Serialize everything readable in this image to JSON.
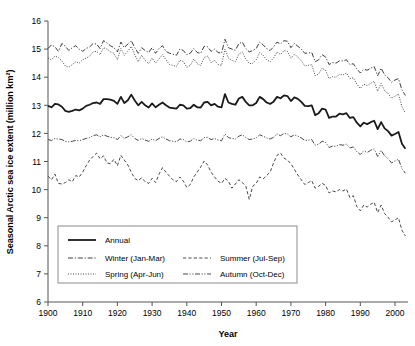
{
  "chart_data": {
    "type": "line",
    "title": "",
    "xlabel": "Year",
    "ylabel": "Seasonal Arctic sea ice extent (million km²)",
    "xlim": [
      1900,
      2004
    ],
    "ylim": [
      6,
      16
    ],
    "xticks": [
      1900,
      1910,
      1920,
      1930,
      1940,
      1950,
      1960,
      1970,
      1980,
      1990,
      2000
    ],
    "yticks": [
      6,
      7,
      8,
      9,
      10,
      11,
      12,
      13,
      14,
      15,
      16
    ],
    "grid": false,
    "legend_position": "lower-left-inside",
    "x": [
      1900,
      1901,
      1902,
      1903,
      1904,
      1905,
      1906,
      1907,
      1908,
      1909,
      1910,
      1911,
      1912,
      1913,
      1914,
      1915,
      1916,
      1917,
      1918,
      1919,
      1920,
      1921,
      1922,
      1923,
      1924,
      1925,
      1926,
      1927,
      1928,
      1929,
      1930,
      1931,
      1932,
      1933,
      1934,
      1935,
      1936,
      1937,
      1938,
      1939,
      1940,
      1941,
      1942,
      1943,
      1944,
      1945,
      1946,
      1947,
      1948,
      1949,
      1950,
      1951,
      1952,
      1953,
      1954,
      1955,
      1956,
      1957,
      1958,
      1959,
      1960,
      1961,
      1962,
      1963,
      1964,
      1965,
      1966,
      1967,
      1968,
      1969,
      1970,
      1971,
      1972,
      1973,
      1974,
      1975,
      1976,
      1977,
      1978,
      1979,
      1980,
      1981,
      1982,
      1983,
      1984,
      1985,
      1986,
      1987,
      1988,
      1989,
      1990,
      1991,
      1992,
      1993,
      1994,
      1995,
      1996,
      1997,
      1998,
      1999,
      2000,
      2001,
      2002,
      2003
    ],
    "series": [
      {
        "name": "Annual",
        "label": "Annual",
        "style": "solid",
        "width": 1.8,
        "color": "#1a1a1a",
        "values": [
          12.98,
          12.93,
          13.05,
          13.03,
          12.95,
          12.8,
          12.77,
          12.8,
          12.85,
          12.82,
          12.88,
          12.98,
          13.02,
          13.08,
          13.1,
          13.05,
          13.22,
          13.22,
          13.2,
          13.16,
          13.05,
          13.3,
          13.08,
          13.18,
          13.38,
          13.17,
          13.0,
          13.12,
          13.0,
          12.92,
          13.07,
          12.93,
          13.02,
          13.1,
          13.0,
          12.92,
          12.9,
          12.88,
          13.02,
          13.0,
          12.88,
          12.9,
          13.02,
          12.93,
          12.92,
          13.1,
          13.12,
          13.0,
          13.05,
          12.95,
          12.93,
          13.4,
          13.1,
          13.05,
          13.02,
          13.24,
          13.3,
          13.12,
          13.0,
          13.0,
          13.08,
          13.3,
          13.22,
          13.1,
          13.05,
          13.13,
          13.3,
          13.25,
          13.35,
          13.33,
          13.15,
          13.28,
          13.23,
          13.12,
          12.98,
          12.97,
          13.0,
          12.65,
          12.72,
          12.88,
          12.85,
          12.55,
          12.6,
          12.6,
          12.7,
          12.68,
          12.72,
          12.55,
          12.58,
          12.38,
          12.25,
          12.38,
          12.33,
          12.4,
          12.45,
          12.15,
          12.4,
          12.18,
          12.08,
          11.92,
          11.98,
          12.05,
          11.63,
          11.45
        ]
      },
      {
        "name": "Winter",
        "label": "Winter (Jan-Mar)",
        "style": "dashdot",
        "width": 0.9,
        "color": "#262626",
        "values": [
          15.02,
          15.15,
          15.08,
          14.92,
          15.2,
          15.1,
          14.95,
          15.05,
          15.12,
          15.0,
          14.92,
          15.02,
          15.08,
          15.2,
          15.18,
          15.02,
          15.3,
          15.22,
          15.12,
          15.05,
          14.9,
          15.25,
          15.05,
          15.18,
          15.3,
          15.05,
          14.85,
          15.05,
          14.95,
          14.88,
          15.05,
          14.85,
          15.02,
          15.12,
          14.92,
          14.85,
          14.82,
          14.78,
          15.0,
          14.95,
          14.8,
          14.85,
          15.02,
          14.88,
          14.85,
          15.1,
          15.08,
          14.92,
          15.0,
          14.88,
          14.85,
          15.35,
          15.05,
          15.0,
          14.96,
          15.2,
          15.25,
          15.02,
          14.9,
          14.95,
          15.02,
          15.25,
          15.15,
          15.02,
          14.95,
          15.08,
          15.25,
          15.18,
          15.3,
          15.28,
          15.05,
          15.2,
          15.1,
          15.0,
          14.85,
          14.86,
          14.88,
          14.55,
          14.62,
          14.8,
          14.72,
          14.45,
          14.52,
          14.5,
          14.58,
          14.58,
          14.62,
          14.45,
          14.48,
          14.3,
          14.15,
          14.28,
          14.25,
          14.32,
          14.38,
          14.05,
          14.32,
          14.08,
          13.98,
          13.82,
          13.9,
          13.95,
          13.55,
          13.35
        ]
      },
      {
        "name": "Spring",
        "label": "Spring (Apr-Jun)",
        "style": "dotted",
        "width": 0.9,
        "color": "#333333",
        "values": [
          14.68,
          14.62,
          14.75,
          14.7,
          14.58,
          14.4,
          14.35,
          14.45,
          14.55,
          14.5,
          14.62,
          14.68,
          14.75,
          14.9,
          14.92,
          14.8,
          15.05,
          15.0,
          14.9,
          14.85,
          14.62,
          15.02,
          14.78,
          14.92,
          15.1,
          14.8,
          14.55,
          14.78,
          14.6,
          14.48,
          14.68,
          14.5,
          14.65,
          14.8,
          14.62,
          14.45,
          14.42,
          14.38,
          14.6,
          14.55,
          14.35,
          14.42,
          14.65,
          14.48,
          14.42,
          14.7,
          14.75,
          14.52,
          14.6,
          14.45,
          14.42,
          15.0,
          14.68,
          14.6,
          14.55,
          14.82,
          14.9,
          14.65,
          14.48,
          14.5,
          14.62,
          14.88,
          14.78,
          14.62,
          14.55,
          14.68,
          14.9,
          14.8,
          14.95,
          14.92,
          14.68,
          14.82,
          14.72,
          14.58,
          14.4,
          14.42,
          14.45,
          14.05,
          14.12,
          14.32,
          14.25,
          13.95,
          14.02,
          14.0,
          14.1,
          14.08,
          14.15,
          13.95,
          13.98,
          13.75,
          13.6,
          13.75,
          13.7,
          13.78,
          13.85,
          13.5,
          13.78,
          13.52,
          13.42,
          13.25,
          13.32,
          13.4,
          12.95,
          12.72
        ]
      },
      {
        "name": "Summer",
        "label": "Summer (Jul-Sep)",
        "style": "dashed",
        "width": 0.9,
        "color": "#333333",
        "values": [
          10.48,
          10.35,
          10.55,
          10.22,
          10.2,
          10.25,
          10.35,
          10.28,
          10.5,
          10.45,
          10.62,
          10.85,
          11.05,
          11.18,
          11.3,
          11.1,
          11.2,
          10.95,
          10.92,
          11.08,
          10.85,
          11.22,
          11.05,
          10.88,
          10.62,
          10.4,
          10.32,
          10.42,
          10.28,
          10.22,
          10.4,
          10.25,
          10.55,
          10.78,
          10.62,
          10.48,
          10.35,
          10.28,
          10.45,
          10.3,
          10.08,
          10.18,
          10.45,
          10.62,
          10.8,
          11.02,
          10.88,
          10.62,
          10.45,
          10.3,
          10.22,
          10.4,
          10.3,
          10.05,
          10.2,
          10.35,
          10.25,
          10.12,
          9.65,
          10.12,
          10.22,
          10.45,
          10.38,
          10.5,
          10.62,
          10.95,
          11.22,
          11.3,
          11.12,
          11.05,
          10.92,
          10.72,
          10.52,
          10.35,
          10.18,
          10.25,
          10.32,
          10.05,
          10.12,
          10.22,
          10.15,
          9.88,
          9.95,
          9.92,
          10.0,
          9.95,
          10.02,
          9.72,
          9.78,
          9.4,
          9.25,
          9.45,
          9.38,
          9.48,
          9.55,
          9.18,
          9.45,
          9.15,
          9.02,
          8.85,
          8.92,
          9.0,
          8.55,
          8.35
        ]
      },
      {
        "name": "Autumn",
        "label": "Autumn (Oct-Dec)",
        "style": "dashdotdot",
        "width": 0.9,
        "color": "#333333",
        "values": [
          11.78,
          11.75,
          11.82,
          11.8,
          11.78,
          11.72,
          11.7,
          11.72,
          11.75,
          11.74,
          11.78,
          11.82,
          11.85,
          11.92,
          11.95,
          11.88,
          11.95,
          11.9,
          11.86,
          11.85,
          11.78,
          11.92,
          11.82,
          11.88,
          11.95,
          11.82,
          11.75,
          11.82,
          11.76,
          11.72,
          11.8,
          11.74,
          11.82,
          11.88,
          11.8,
          11.74,
          11.72,
          11.7,
          11.8,
          11.78,
          11.7,
          11.72,
          11.82,
          11.76,
          11.74,
          11.85,
          11.86,
          11.78,
          11.82,
          11.76,
          11.74,
          11.98,
          11.85,
          11.82,
          11.8,
          11.9,
          11.95,
          11.85,
          11.78,
          11.8,
          11.84,
          11.95,
          11.9,
          11.84,
          11.8,
          11.86,
          11.98,
          11.92,
          12.0,
          11.98,
          11.88,
          11.95,
          11.9,
          11.84,
          11.75,
          11.76,
          11.78,
          11.58,
          11.62,
          11.72,
          11.68,
          11.5,
          11.55,
          11.54,
          11.6,
          11.58,
          11.62,
          11.48,
          11.52,
          11.35,
          11.25,
          11.38,
          11.32,
          11.4,
          11.45,
          11.18,
          11.4,
          11.2,
          11.1,
          10.95,
          11.02,
          11.08,
          10.75,
          10.58
        ]
      }
    ]
  },
  "legend": {
    "entries": [
      {
        "label": "Annual",
        "style": "solid"
      },
      {
        "label": "Winter (Jan-Mar)",
        "style": "dashdot"
      },
      {
        "label": "Summer (Jul-Sep)",
        "style": "dashed"
      },
      {
        "label": "Spring (Apr-Jun)",
        "style": "dotted"
      },
      {
        "label": "Autumn (Oct-Dec)",
        "style": "dashdotdot"
      }
    ]
  }
}
